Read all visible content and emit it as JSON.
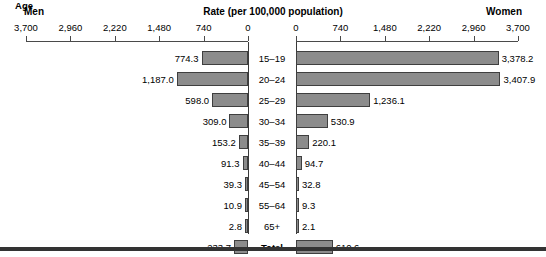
{
  "header": {
    "men_label": "Men",
    "women_label": "Women",
    "rate_title": "Rate (per 100,000 population)",
    "age_label": "Age"
  },
  "axis": {
    "left_ticks": [
      "3,700",
      "2,960",
      "2,220",
      "1,480",
      "740",
      "0"
    ],
    "right_ticks": [
      "0",
      "740",
      "1,480",
      "2,220",
      "2,960",
      "3,700"
    ]
  },
  "colors": {
    "bar_fill": "#8c8c8c",
    "bar_stroke": "#3f3f3f",
    "axis": "#4a4a4a",
    "bottom_rule": "#333333",
    "text": "#000000"
  },
  "chart_data": {
    "type": "bar",
    "title": "Rate (per 100,000 population)",
    "subtype": "population-pyramid",
    "xlabel": "Rate (per 100,000 population)",
    "ylabel": "Age",
    "xlim": [
      0,
      3700
    ],
    "tick_step": 740,
    "grid": false,
    "legend": "none",
    "categories": [
      "15–19",
      "20–24",
      "25–29",
      "30–34",
      "35–39",
      "40–44",
      "45–54",
      "55–64",
      "65+",
      "Total"
    ],
    "series": [
      {
        "name": "Men",
        "side": "left",
        "values": [
          774.3,
          1187.0,
          598.0,
          309.0,
          153.2,
          91.3,
          39.3,
          10.9,
          2.8,
          233.7
        ],
        "labels": [
          "774.3",
          "1,187.0",
          "598.0",
          "309.0",
          "153.2",
          "91.3",
          "39.3",
          "10.9",
          "2.8",
          "233.7"
        ]
      },
      {
        "name": "Women",
        "side": "right",
        "values": [
          3378.2,
          3407.9,
          1236.1,
          530.9,
          220.1,
          94.7,
          32.8,
          9.3,
          2.1,
          610.6
        ],
        "labels": [
          "3,378.2",
          "3,407.9",
          "1,236.1",
          "530.9",
          "220.1",
          "94.7",
          "32.8",
          "9.3",
          "2.1",
          "610.6"
        ]
      }
    ]
  }
}
